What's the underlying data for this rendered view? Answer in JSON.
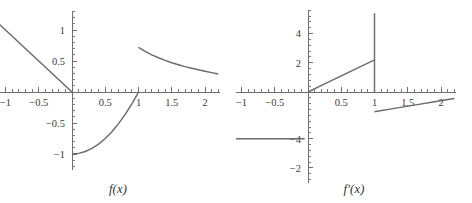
{
  "figure": {
    "background_color": "#ffffff",
    "curve_color": "#6b6b6b",
    "axis_color": "#6d6d6d",
    "label_color": "#3a3a3a"
  },
  "panels": [
    {
      "id": "left",
      "caption": "f(x)",
      "caption_plain": "f(x)"
    },
    {
      "id": "right",
      "caption": "f′(x)",
      "caption_plain": "f'(x)"
    }
  ],
  "chart_data": [
    {
      "type": "line",
      "title": "f(x)",
      "xlabel": "",
      "ylabel": "",
      "xlim": [
        -1.18,
        2.22
      ],
      "ylim": [
        -1.25,
        1.3
      ],
      "grid": false,
      "legend": "none",
      "axes_style": "centered-cross-with-ticks",
      "xticks": [
        -1,
        -0.5,
        0.5,
        1,
        1.5,
        2
      ],
      "xticklabels": [
        "-1",
        "-0.5",
        "0.5",
        "1",
        "1.5",
        "2"
      ],
      "yticks": [
        1,
        0.5,
        -0.5,
        -1
      ],
      "yticklabels": [
        "1",
        "0.5",
        "-0.5",
        "-1"
      ],
      "x_minor_tick_step": 0.1,
      "y_minor_tick_step": 0.1,
      "series": [
        {
          "name": "left-linear-branch",
          "description": "descending straight line from upper left to origin",
          "x": [
            -1.18,
            -1.0,
            -0.75,
            -0.5,
            -0.25,
            0.0
          ],
          "values": [
            1.18,
            1.0,
            0.75,
            0.5,
            0.25,
            0.0
          ]
        },
        {
          "name": "middle-concave-branch",
          "description": "rises from (0,-1) steeply up to (1,0)",
          "x": [
            0.0,
            0.1,
            0.2,
            0.3,
            0.4,
            0.5,
            0.6,
            0.7,
            0.8,
            0.9,
            0.95,
            1.0
          ],
          "values": [
            -1.0,
            -0.99,
            -0.96,
            -0.91,
            -0.84,
            -0.75,
            -0.64,
            -0.51,
            -0.36,
            -0.19,
            -0.0975,
            0.0
          ]
        },
        {
          "name": "right-decaying-branch",
          "description": "starts at (1,0.72) and decays toward (2.2,0.26)",
          "x": [
            1.0,
            1.1,
            1.2,
            1.3,
            1.4,
            1.5,
            1.6,
            1.7,
            1.8,
            1.9,
            2.0,
            2.1,
            2.2
          ],
          "values": [
            0.72,
            0.655,
            0.6,
            0.552,
            0.51,
            0.472,
            0.44,
            0.41,
            0.383,
            0.358,
            0.335,
            0.313,
            0.29
          ]
        }
      ],
      "discontinuity_at_x": 1
    },
    {
      "type": "line",
      "title": "f'(x)",
      "xlabel": "",
      "ylabel": "",
      "xlim": [
        -1.18,
        2.22
      ],
      "ylim": [
        -6.2,
        5.6
      ],
      "grid": false,
      "legend": "none",
      "axes_style": "centered-cross-with-ticks",
      "xticks": [
        -1,
        -0.5,
        0.5,
        1,
        1.5,
        2
      ],
      "xticklabels": [
        "-1",
        "-0.5",
        "0.5",
        "1",
        "1.5",
        "2"
      ],
      "yticks": [
        4,
        2,
        -4,
        -2
      ],
      "yticklabels": [
        "4",
        "2",
        "-4",
        "-2"
      ],
      "ytick_values_as_drawn": [
        4,
        2,
        -3.2,
        -5.2
      ],
      "ytick_label_note": "y-axis labels appear out of order in the source figure: 4, 2, then -4 above -2",
      "x_minor_tick_step": 0.1,
      "y_minor_tick_step": 0.4,
      "series": [
        {
          "name": "left-constant-branch",
          "description": "flat horizontal segment at about y = -3.2 for x < 0",
          "x": [
            -1.18,
            -0.9,
            -0.6,
            -0.3,
            -0.05
          ],
          "values": [
            -3.2,
            -3.2,
            -3.2,
            -3.2,
            -3.2
          ]
        },
        {
          "name": "middle-ramp-branch",
          "description": "straight ramp rising from origin to about (1, 2.2)",
          "x": [
            0.0,
            0.25,
            0.5,
            0.75,
            1.0
          ],
          "values": [
            0.0,
            0.55,
            1.1,
            1.65,
            2.2
          ]
        },
        {
          "name": "vertical-spike",
          "description": "vertical segment at x = 1 from the axis up past the top of the frame",
          "x": [
            1.0,
            1.0
          ],
          "values": [
            0.0,
            5.4
          ]
        },
        {
          "name": "right-rising-branch",
          "description": "gently rising segment from (1, -1.35) to (2.2, -0.45)",
          "x": [
            1.0,
            1.3,
            1.6,
            1.9,
            2.2
          ],
          "values": [
            -1.35,
            -1.12,
            -0.9,
            -0.67,
            -0.45
          ]
        }
      ],
      "discontinuity_at_x": 1
    }
  ]
}
